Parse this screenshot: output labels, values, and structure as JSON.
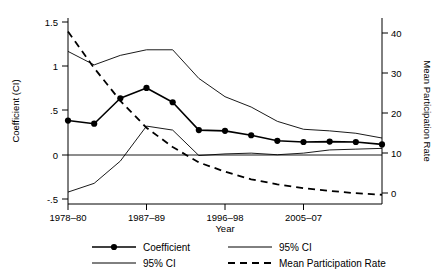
{
  "chart_data": {
    "type": "line",
    "title": "",
    "xlabel": "Year",
    "ylabel": "Coefficient (CI)",
    "y2label": "Mean Participation Rate",
    "grid": false,
    "legend_position": "bottom",
    "xlim": [
      0,
      12
    ],
    "ylim": [
      -0.72,
      1.62
    ],
    "y2lim": [
      -1.8,
      46.5
    ],
    "xticks": [
      0,
      3,
      6,
      9
    ],
    "xticklabels": [
      "1978–80",
      "1987–89",
      "1996–98",
      "2005–07"
    ],
    "yticks": [
      -0.5,
      0,
      0.5,
      1,
      1.5
    ],
    "yticklabels": [
      "-.5",
      "0",
      ".5",
      "1",
      "1.5"
    ],
    "y2ticks": [
      0,
      10,
      20,
      30,
      40
    ],
    "y2ticklabels": [
      "0",
      "10",
      "20",
      "30",
      "40"
    ],
    "x": [
      0,
      1,
      2,
      3,
      4,
      5,
      6,
      7,
      8,
      9,
      10,
      11,
      12
    ],
    "series": [
      {
        "name": "Coefficient",
        "axis": "left",
        "style": "solid-marker",
        "values": [
          0.33,
          0.29,
          0.61,
          0.74,
          0.56,
          0.21,
          0.2,
          0.145,
          0.075,
          0.06,
          0.065,
          0.06,
          0.03
        ]
      },
      {
        "name": "95% CI",
        "axis": "left",
        "style": "solid-thin",
        "values": [
          1.2,
          1.03,
          1.15,
          1.22,
          1.22,
          0.86,
          0.63,
          0.5,
          0.32,
          0.22,
          0.2,
          0.17,
          0.11
        ]
      },
      {
        "name": "95% CI",
        "axis": "left",
        "style": "solid-thin",
        "values": [
          -0.57,
          -0.46,
          -0.18,
          0.26,
          0.21,
          -0.11,
          -0.09,
          -0.08,
          -0.1,
          -0.08,
          -0.04,
          -0.03,
          -0.02
        ]
      },
      {
        "name": "Mean Participation Rate",
        "axis": "right",
        "style": "dashed",
        "values": [
          43.0,
          33.5,
          25.0,
          18.0,
          13.0,
          9.0,
          6.6,
          4.6,
          3.3,
          2.3,
          1.6,
          1.0,
          0.6
        ]
      }
    ],
    "legend_entries": [
      {
        "label": "Coefficient",
        "style": "solid-marker"
      },
      {
        "label": "95% CI",
        "style": "solid-thin"
      },
      {
        "label": "95% CI",
        "style": "solid-thin"
      },
      {
        "label": "Mean Participation Rate",
        "style": "dashed"
      }
    ]
  }
}
